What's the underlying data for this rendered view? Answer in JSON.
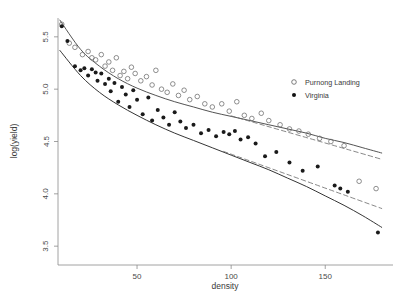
{
  "chart_data": {
    "type": "scatter",
    "title": "",
    "xlabel": "density",
    "ylabel": "log(yield)",
    "xlim": [
      8,
      186
    ],
    "ylim": [
      3.32,
      5.68
    ],
    "xticks": [
      50,
      100,
      150
    ],
    "xtick_labels": [
      "50",
      "100",
      "150"
    ],
    "yticks": [
      3.5,
      4.0,
      4.5,
      5.0,
      5.5
    ],
    "ytick_labels": [
      "3.5",
      "4.0",
      "4.5",
      "5.0",
      "5.5"
    ],
    "grid": false,
    "legend_position": "upper-right",
    "legend": [
      {
        "label": "Purnong Landing",
        "marker": "open-circle",
        "color": "#555555"
      },
      {
        "label": "Virginia",
        "marker": "filled-circle",
        "color": "#111111"
      }
    ],
    "series": [
      {
        "name": "Purnong Landing",
        "marker": "open-circle",
        "color": "#6a6a6a",
        "points": [
          [
            10,
            5.62
          ],
          [
            14,
            5.44
          ],
          [
            17,
            5.4
          ],
          [
            21,
            5.33
          ],
          [
            24,
            5.36
          ],
          [
            26,
            5.3
          ],
          [
            28,
            5.28
          ],
          [
            31,
            5.33
          ],
          [
            33,
            5.22
          ],
          [
            35,
            5.26
          ],
          [
            37,
            5.18
          ],
          [
            39,
            5.3
          ],
          [
            41,
            5.13
          ],
          [
            43,
            5.17
          ],
          [
            45,
            5.1
          ],
          [
            47,
            5.21
          ],
          [
            49,
            5.15
          ],
          [
            52,
            5.08
          ],
          [
            55,
            5.12
          ],
          [
            58,
            5.04
          ],
          [
            60,
            5.18
          ],
          [
            63,
            5.0
          ],
          [
            66,
            4.97
          ],
          [
            69,
            5.05
          ],
          [
            72,
            4.94
          ],
          [
            75,
            4.99
          ],
          [
            78,
            4.9
          ],
          [
            82,
            4.93
          ],
          [
            86,
            4.86
          ],
          [
            90,
            4.83
          ],
          [
            95,
            4.86
          ],
          [
            99,
            4.79
          ],
          [
            103,
            4.88
          ],
          [
            107,
            4.75
          ],
          [
            111,
            4.72
          ],
          [
            116,
            4.77
          ],
          [
            120,
            4.7
          ],
          [
            126,
            4.66
          ],
          [
            131,
            4.62
          ],
          [
            136,
            4.6
          ],
          [
            141,
            4.57
          ],
          [
            147,
            4.53
          ],
          [
            153,
            4.5
          ],
          [
            160,
            4.46
          ],
          [
            168,
            4.12
          ],
          [
            177,
            4.05
          ]
        ]
      },
      {
        "name": "Virginia",
        "marker": "filled-circle",
        "color": "#1a1a1a",
        "points": [
          [
            10,
            5.6
          ],
          [
            13,
            5.46
          ],
          [
            17,
            5.22
          ],
          [
            20,
            5.18
          ],
          [
            22,
            5.2
          ],
          [
            24,
            5.13
          ],
          [
            26,
            5.19
          ],
          [
            28,
            5.16
          ],
          [
            29,
            5.08
          ],
          [
            31,
            5.15
          ],
          [
            33,
            5.05
          ],
          [
            35,
            5.1
          ],
          [
            36,
            4.98
          ],
          [
            38,
            5.06
          ],
          [
            40,
            4.88
          ],
          [
            42,
            5.02
          ],
          [
            44,
            4.95
          ],
          [
            46,
            4.83
          ],
          [
            48,
            4.99
          ],
          [
            50,
            4.9
          ],
          [
            53,
            4.76
          ],
          [
            56,
            4.92
          ],
          [
            58,
            4.7
          ],
          [
            61,
            4.8
          ],
          [
            64,
            4.73
          ],
          [
            67,
            4.66
          ],
          [
            70,
            4.78
          ],
          [
            73,
            4.69
          ],
          [
            76,
            4.63
          ],
          [
            80,
            4.66
          ],
          [
            84,
            4.58
          ],
          [
            88,
            4.61
          ],
          [
            92,
            4.55
          ],
          [
            96,
            4.59
          ],
          [
            99,
            4.57
          ],
          [
            102,
            4.6
          ],
          [
            105,
            4.52
          ],
          [
            109,
            4.54
          ],
          [
            113,
            4.48
          ],
          [
            118,
            4.36
          ],
          [
            124,
            4.4
          ],
          [
            131,
            4.3
          ],
          [
            138,
            4.22
          ],
          [
            146,
            4.26
          ],
          [
            155,
            4.08
          ],
          [
            158,
            4.05
          ],
          [
            162,
            4.02
          ],
          [
            178,
            3.63
          ]
        ]
      }
    ],
    "fits": [
      {
        "name": "Purnong Landing curved fit",
        "style": "solid",
        "color": "#4a4a4a",
        "points": [
          [
            9,
            5.66
          ],
          [
            20,
            5.38
          ],
          [
            30,
            5.22
          ],
          [
            40,
            5.1
          ],
          [
            50,
            5.01
          ],
          [
            60,
            4.94
          ],
          [
            70,
            4.88
          ],
          [
            80,
            4.83
          ],
          [
            90,
            4.78
          ],
          [
            100,
            4.74
          ],
          [
            110,
            4.7
          ],
          [
            120,
            4.66
          ],
          [
            130,
            4.62
          ],
          [
            140,
            4.58
          ],
          [
            150,
            4.53
          ],
          [
            160,
            4.49
          ],
          [
            170,
            4.44
          ],
          [
            180,
            4.39
          ]
        ]
      },
      {
        "name": "Purnong Landing linear fit",
        "style": "dashed",
        "color": "#6a6a6a",
        "points": [
          [
            100,
            4.745
          ],
          [
            180,
            4.33
          ]
        ]
      },
      {
        "name": "Virginia curved fit",
        "style": "solid",
        "color": "#2a2a2a",
        "points": [
          [
            9,
            5.37
          ],
          [
            20,
            5.13
          ],
          [
            30,
            4.97
          ],
          [
            40,
            4.85
          ],
          [
            50,
            4.75
          ],
          [
            60,
            4.66
          ],
          [
            70,
            4.58
          ],
          [
            80,
            4.51
          ],
          [
            90,
            4.44
          ],
          [
            100,
            4.37
          ],
          [
            110,
            4.3
          ],
          [
            120,
            4.23
          ],
          [
            130,
            4.15
          ],
          [
            140,
            4.07
          ],
          [
            150,
            3.98
          ],
          [
            160,
            3.89
          ],
          [
            170,
            3.79
          ],
          [
            180,
            3.68
          ]
        ]
      },
      {
        "name": "Virginia linear fit",
        "style": "dashed",
        "color": "#6a6a6a",
        "points": [
          [
            96,
            4.405
          ],
          [
            180,
            3.86
          ]
        ]
      }
    ]
  },
  "axes": {
    "xlabel": "density",
    "ylabel": "log(yield)"
  }
}
